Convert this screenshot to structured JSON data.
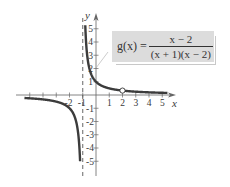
{
  "chart_data": {
    "type": "line",
    "title": "",
    "function_label": "g(x) =",
    "function_numerator": "x − 2",
    "function_denominator": "(x + 1)(x − 2)",
    "xlabel": "x",
    "ylabel": "y",
    "xlim": [
      -6,
      6
    ],
    "ylim": [
      -6,
      6
    ],
    "x_ticks": [
      -5,
      -4,
      -3,
      -2,
      -1,
      0,
      1,
      2,
      3,
      4,
      5
    ],
    "x_tick_labels": [
      "-2",
      "-1",
      "1",
      "2",
      "3",
      "4",
      "5"
    ],
    "x_tick_label_values": [
      -2,
      -1,
      1,
      2,
      3,
      4,
      5
    ],
    "y_ticks": [
      -5,
      -4,
      -3,
      -2,
      -1,
      1,
      2,
      3,
      4,
      5
    ],
    "y_tick_labels": [
      "5",
      "4",
      "3",
      "2",
      "1",
      "-1",
      "-2",
      "-3",
      "-4",
      "-5"
    ],
    "y_tick_label_values": [
      5,
      4,
      3,
      2,
      1,
      -1,
      -2,
      -3,
      -4,
      -5
    ],
    "grid": false,
    "vertical_asymptote": {
      "x": -1,
      "style": "dashed"
    },
    "hole": {
      "x": 2,
      "y": 0.3333
    },
    "series": [
      {
        "name": "right branch",
        "x": [
          -0.81,
          -0.7,
          -0.6,
          -0.5,
          -0.4,
          -0.2,
          0,
          0.5,
          1,
          1.5,
          2,
          3,
          4,
          5,
          5.4
        ],
        "y": [
          5.26,
          3.33,
          2.5,
          2.0,
          1.67,
          1.25,
          1.0,
          0.667,
          0.5,
          0.4,
          0.333,
          0.25,
          0.2,
          0.167,
          0.156
        ]
      },
      {
        "name": "left branch",
        "x": [
          -5.4,
          -5,
          -4,
          -3,
          -2.5,
          -2,
          -1.7,
          -1.5,
          -1.4,
          -1.3,
          -1.25,
          -1.2
        ],
        "y": [
          -0.227,
          -0.25,
          -0.333,
          -0.5,
          -0.667,
          -1.0,
          -1.43,
          -2.0,
          -2.5,
          -3.33,
          -4.0,
          -5.0
        ]
      }
    ],
    "legend": "none"
  }
}
